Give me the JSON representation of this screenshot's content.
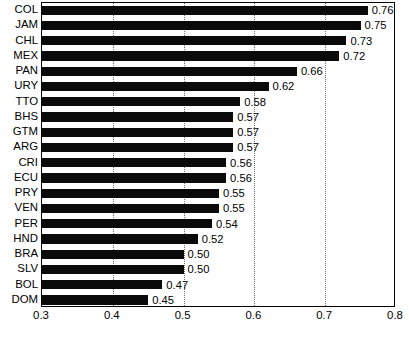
{
  "chart_data": {
    "type": "bar",
    "orientation": "horizontal",
    "title": "",
    "xlabel": "",
    "ylabel": "",
    "xlim": [
      0.3,
      0.8
    ],
    "xticks": [
      "0.3",
      "0.4",
      "0.5",
      "0.6",
      "0.7",
      "0.8"
    ],
    "xtick_values": [
      0.3,
      0.4,
      0.5,
      0.6,
      0.7,
      0.8
    ],
    "gridlines": [
      0.4,
      0.5,
      0.6,
      0.7
    ],
    "grid": true,
    "grid_style": "dotted",
    "legend": null,
    "bar_color": "#0a0a0a",
    "frame_color": "#000000",
    "categories": [
      "COL",
      "JAM",
      "CHL",
      "MEX",
      "PAN",
      "URY",
      "TTO",
      "BHS",
      "GTM",
      "ARG",
      "CRI",
      "ECU",
      "PRY",
      "VEN",
      "PER",
      "HND",
      "BRA",
      "SLV",
      "BOL",
      "DOM"
    ],
    "values": [
      0.76,
      0.75,
      0.73,
      0.72,
      0.66,
      0.62,
      0.58,
      0.57,
      0.57,
      0.57,
      0.56,
      0.56,
      0.55,
      0.55,
      0.54,
      0.52,
      0.5,
      0.5,
      0.47,
      0.45
    ],
    "value_labels": [
      "0.76",
      "0.75",
      "0.73",
      "0.72",
      "0.66",
      "0.62",
      "0.58",
      "0.57",
      "0.57",
      "0.57",
      "0.56",
      "0.56",
      "0.55",
      "0.55",
      "0.54",
      "0.52",
      "0.50",
      "0.50",
      "0.47",
      "0.45"
    ]
  },
  "caption": {
    "text": ""
  }
}
